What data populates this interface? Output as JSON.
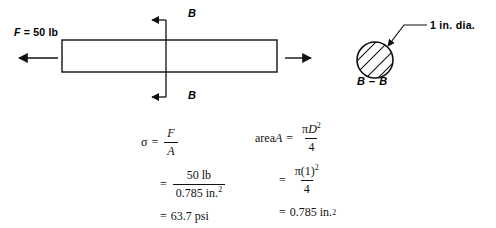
{
  "figure": {
    "type": "engineering-stress-diagram"
  },
  "bar_diagram": {
    "force_label": {
      "symbol": "F",
      "rest": " = 50 lb"
    },
    "section_label_top": "B",
    "section_label_bottom": "B",
    "left_arrow_name": "force-arrow-left",
    "right_arrow_name": "force-arrow-right"
  },
  "section_view": {
    "caption_left": "B",
    "caption_dash": " – ",
    "caption_right": "B",
    "dimension_label": "1 in. dia."
  },
  "equations": {
    "stress": {
      "line1": {
        "lhs": "σ",
        "eq": "=",
        "num": "F",
        "den": "A"
      },
      "line2": {
        "eq": "=",
        "num": "50 lb",
        "den_value": "0.785 in.",
        "den_sup": "2"
      },
      "line3": {
        "eq": "=",
        "value": "63.7 psi"
      }
    },
    "area": {
      "line1": {
        "lhs_plain": "area ",
        "lhs_it": "A",
        "eq": "=",
        "num_pi": "π",
        "num_d": "D",
        "num_sup": "2",
        "den": "4"
      },
      "line2": {
        "eq": "=",
        "num": "π(1)",
        "num_sup": "2",
        "den": "4"
      },
      "line3": {
        "eq": "=",
        "value": "0.785 in.",
        "sup": "2"
      }
    }
  },
  "colors": {
    "ink": "#000000",
    "math_ink": "#111111",
    "background": "#ffffff"
  }
}
